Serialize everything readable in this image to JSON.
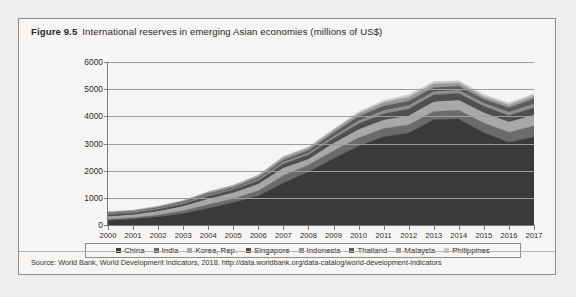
{
  "figure": {
    "number": "Figure 9.5",
    "caption": "International reserves in emerging Asian economies (millions of US$)",
    "source": "Source: World Bank, World Development Indicators, 2018. http://data.worldbank.org/data-catalog/world-development-indicators"
  },
  "chart_data": {
    "type": "area",
    "stacked": true,
    "title": "International reserves in emerging Asian economies (millions of US$)",
    "xlabel": "",
    "ylabel": "",
    "ylim": [
      0,
      6000
    ],
    "ytick_labels": [
      "0",
      "1000",
      "2000",
      "3000",
      "4000",
      "5000",
      "6000"
    ],
    "ytick_values": [
      0,
      1000,
      2000,
      3000,
      4000,
      5000,
      6000
    ],
    "grid": true,
    "legend_position": "bottom",
    "categories": [
      "2000",
      "2001",
      "2002",
      "2003",
      "2004",
      "2005",
      "2006",
      "2007",
      "2008",
      "2009",
      "2010",
      "2011",
      "2012",
      "2013",
      "2014",
      "2015",
      "2016",
      "2017"
    ],
    "series": [
      {
        "name": "China",
        "color": "#3a3a3a",
        "values": [
          170,
          220,
          300,
          420,
          620,
          830,
          1080,
          1550,
          1960,
          2450,
          2910,
          3250,
          3390,
          3880,
          3900,
          3400,
          3050,
          3240
        ]
      },
      {
        "name": "India",
        "color": "#6b6b6b",
        "values": [
          40,
          48,
          72,
          103,
          131,
          137,
          178,
          275,
          252,
          279,
          300,
          298,
          297,
          298,
          322,
          352,
          362,
          410
        ]
      },
      {
        "name": "Korea, Rep.",
        "color": "#a8a8a8",
        "values": [
          96,
          103,
          122,
          155,
          199,
          210,
          239,
          262,
          201,
          270,
          292,
          307,
          327,
          346,
          363,
          368,
          371,
          389
        ]
      },
      {
        "name": "Singapore",
        "color": "#4f4f4f",
        "values": [
          80,
          75,
          82,
          96,
          113,
          116,
          136,
          163,
          174,
          188,
          226,
          238,
          259,
          273,
          257,
          248,
          247,
          280
        ]
      },
      {
        "name": "Indonesia",
        "color": "#8d8d8d",
        "values": [
          29,
          28,
          32,
          36,
          36,
          35,
          43,
          57,
          51,
          66,
          96,
          110,
          113,
          99,
          112,
          106,
          116,
          130
        ]
      },
      {
        "name": "Thailand",
        "color": "#5c5c5c",
        "values": [
          32,
          33,
          38,
          42,
          49,
          52,
          67,
          87,
          111,
          138,
          172,
          175,
          181,
          167,
          157,
          156,
          172,
          202
        ]
      },
      {
        "name": "Malaysia",
        "color": "#999999",
        "values": [
          29,
          30,
          34,
          44,
          66,
          70,
          82,
          101,
          92,
          96,
          107,
          134,
          140,
          135,
          116,
          95,
          95,
          102
        ]
      },
      {
        "name": "Philippines",
        "color": "#c9c9c9",
        "values": [
          15,
          15,
          16,
          17,
          16,
          18,
          23,
          34,
          37,
          44,
          62,
          75,
          84,
          83,
          80,
          81,
          81,
          82
        ]
      }
    ],
    "totals": [
      491,
      552,
      696,
      913,
      1230,
      1468,
      1848,
      2529,
      2878,
      3531,
      4165,
      4587,
      4791,
      5281,
      5307,
      4806,
      4494,
      4835
    ]
  },
  "colors": {
    "card_background": "#f6f5f3",
    "page_background": "#efeeec",
    "border": "#8e8d8a",
    "axis": "#7d7c79",
    "grid": "#9e9d9a",
    "text": "#2a2a2a"
  }
}
